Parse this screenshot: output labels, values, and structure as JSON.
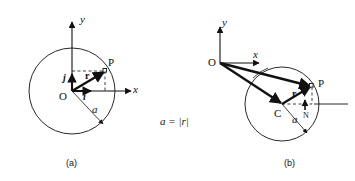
{
  "figure": {
    "equation": "a = |r|",
    "panels": [
      {
        "caption": "(a)",
        "axes": {
          "x_label": "x",
          "y_label": "y"
        },
        "points": [
          {
            "name": "origin",
            "label": "O"
          },
          {
            "name": "point-p",
            "label": "P"
          }
        ],
        "vectors": [
          {
            "name": "position-vector",
            "label": "r"
          },
          {
            "name": "unit-vector-i",
            "label": "i"
          },
          {
            "name": "unit-vector-j",
            "label": "j"
          }
        ],
        "radius": {
          "label": "a"
        }
      },
      {
        "caption": "(b)",
        "axes": {
          "x_label": "x",
          "y_label": "y"
        },
        "points": [
          {
            "name": "origin",
            "label": "O"
          },
          {
            "name": "center",
            "label": "C"
          },
          {
            "name": "point-p",
            "label": "P"
          },
          {
            "name": "foot-n",
            "label": "N"
          }
        ],
        "vectors": [
          {
            "name": "position-vector",
            "label": "r"
          }
        ],
        "radius": {
          "label": "a"
        }
      }
    ],
    "colors": {
      "ink": "#111111",
      "background": "#ffffff"
    }
  }
}
